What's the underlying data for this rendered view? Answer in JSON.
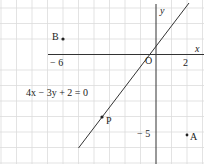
{
  "diagram": {
    "axes": {
      "x_label": "x",
      "y_label": "y",
      "origin_label": "O"
    },
    "tick_labels": {
      "x_neg6": "− 6",
      "x_2": "2",
      "y_neg5": "− 5"
    },
    "equation": "4x − 3y + 2 = 0",
    "points": [
      {
        "label": "B",
        "x": -6,
        "y": 1
      },
      {
        "label": "P",
        "x": -3.5,
        "y": -4
      },
      {
        "label": "A",
        "x": 2,
        "y": -5
      }
    ],
    "line": {
      "equation": "4x - 3y + 2 = 0",
      "from": [
        -5,
        -6
      ],
      "to": [
        2.1,
        3.5
      ]
    },
    "colors": {
      "grid": "#d9d9d9",
      "axis": "#333333",
      "line": "#333333"
    }
  }
}
